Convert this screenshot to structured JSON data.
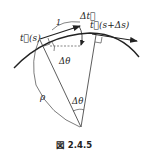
{
  "labels": {
    "t_s": "t⃗(s)",
    "one": "1",
    "delta_t": "Δt⃗",
    "t_s_ds": "t⃗(s+Δs)",
    "delta_theta_top": "Δθ",
    "rho": "ρ",
    "delta_theta_center": "Δθ"
  },
  "caption": "図 2.4.5",
  "colors": {
    "stroke": "#222222",
    "background": "#ffffff"
  }
}
